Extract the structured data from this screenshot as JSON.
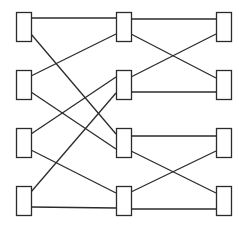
{
  "diagram": {
    "type": "butterfly-network",
    "stroke_color": "#2b2b2b",
    "background": "#ffffff",
    "box_size": {
      "w": 15,
      "h": 29
    },
    "nodes": [
      {
        "id": "L1",
        "col": 0,
        "row": 0,
        "x": 16,
        "y": 12
      },
      {
        "id": "L2",
        "col": 0,
        "row": 1,
        "x": 16,
        "y": 70
      },
      {
        "id": "L3",
        "col": 0,
        "row": 2,
        "x": 16,
        "y": 128
      },
      {
        "id": "L4",
        "col": 0,
        "row": 3,
        "x": 16,
        "y": 186
      },
      {
        "id": "M1",
        "col": 1,
        "row": 0,
        "x": 116,
        "y": 12
      },
      {
        "id": "M2",
        "col": 1,
        "row": 1,
        "x": 116,
        "y": 70
      },
      {
        "id": "M3",
        "col": 1,
        "row": 2,
        "x": 116,
        "y": 128
      },
      {
        "id": "M4",
        "col": 1,
        "row": 3,
        "x": 116,
        "y": 186
      },
      {
        "id": "R1",
        "col": 2,
        "row": 0,
        "x": 216,
        "y": 12
      },
      {
        "id": "R2",
        "col": 2,
        "row": 1,
        "x": 216,
        "y": 70
      },
      {
        "id": "R3",
        "col": 2,
        "row": 2,
        "x": 216,
        "y": 128
      },
      {
        "id": "R4",
        "col": 2,
        "row": 3,
        "x": 216,
        "y": 186
      }
    ],
    "edges": [
      {
        "from": "L1",
        "to": "M1",
        "x1": 31,
        "y1": 18,
        "x2": 116,
        "y2": 18
      },
      {
        "from": "L1",
        "to": "M3",
        "x1": 31,
        "y1": 34,
        "x2": 116,
        "y2": 134
      },
      {
        "from": "L2",
        "to": "M1",
        "x1": 31,
        "y1": 76,
        "x2": 116,
        "y2": 34
      },
      {
        "from": "L2",
        "to": "M3",
        "x1": 31,
        "y1": 92,
        "x2": 116,
        "y2": 149
      },
      {
        "from": "L3",
        "to": "M2",
        "x1": 31,
        "y1": 134,
        "x2": 116,
        "y2": 77
      },
      {
        "from": "L3",
        "to": "M4",
        "x1": 31,
        "y1": 150,
        "x2": 116,
        "y2": 193
      },
      {
        "from": "L4",
        "to": "M2",
        "x1": 31,
        "y1": 192,
        "x2": 116,
        "y2": 93
      },
      {
        "from": "L4",
        "to": "M4",
        "x1": 31,
        "y1": 207,
        "x2": 116,
        "y2": 208
      },
      {
        "from": "M1",
        "to": "R1",
        "x1": 131,
        "y1": 19,
        "x2": 216,
        "y2": 19
      },
      {
        "from": "M1",
        "to": "R2",
        "x1": 131,
        "y1": 34,
        "x2": 216,
        "y2": 78
      },
      {
        "from": "M2",
        "to": "R1",
        "x1": 131,
        "y1": 77,
        "x2": 216,
        "y2": 34
      },
      {
        "from": "M2",
        "to": "R2",
        "x1": 131,
        "y1": 92,
        "x2": 216,
        "y2": 92
      },
      {
        "from": "M3",
        "to": "R3",
        "x1": 131,
        "y1": 136,
        "x2": 216,
        "y2": 136
      },
      {
        "from": "M3",
        "to": "R4",
        "x1": 131,
        "y1": 151,
        "x2": 216,
        "y2": 193
      },
      {
        "from": "M4",
        "to": "R3",
        "x1": 131,
        "y1": 192,
        "x2": 216,
        "y2": 151
      },
      {
        "from": "M4",
        "to": "R4",
        "x1": 131,
        "y1": 209,
        "x2": 216,
        "y2": 209
      }
    ]
  }
}
